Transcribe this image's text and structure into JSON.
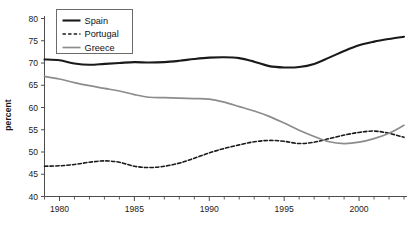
{
  "chart_data": {
    "type": "line",
    "title": "",
    "xlabel": "",
    "ylabel": "percent",
    "xlim": [
      1979,
      2003
    ],
    "ylim": [
      40,
      80
    ],
    "grid": false,
    "legend_position": "top-left",
    "y_ticks": [
      40,
      45,
      50,
      55,
      60,
      65,
      70,
      75,
      80
    ],
    "x_ticks_major": [
      1980,
      1985,
      1990,
      1995,
      2000
    ],
    "x_ticks_minor": [
      1979,
      1981,
      1982,
      1983,
      1984,
      1986,
      1987,
      1988,
      1989,
      1991,
      1992,
      1993,
      1994,
      1996,
      1997,
      1998,
      1999,
      2001,
      2002,
      2003
    ],
    "x": [
      1979,
      1980,
      1981,
      1982,
      1983,
      1984,
      1985,
      1986,
      1987,
      1988,
      1989,
      1990,
      1991,
      1992,
      1993,
      1994,
      1995,
      1996,
      1997,
      1998,
      1999,
      2000,
      2001,
      2002,
      2003
    ],
    "series": [
      {
        "name": "Spain",
        "color": "#1a1a1a",
        "style": "solid",
        "width": 2.1,
        "values": [
          70.8,
          70.6,
          69.9,
          69.6,
          69.8,
          70.0,
          70.2,
          70.1,
          70.2,
          70.5,
          70.9,
          71.2,
          71.3,
          71.1,
          70.3,
          69.3,
          69.0,
          69.1,
          69.8,
          71.2,
          72.7,
          74.0,
          74.8,
          75.4,
          75.9
        ]
      },
      {
        "name": "Portugal",
        "color": "#1a1a1a",
        "style": "dashed",
        "width": 1.6,
        "values": [
          46.8,
          46.9,
          47.2,
          47.7,
          48.0,
          47.7,
          46.8,
          46.5,
          46.8,
          47.5,
          48.6,
          49.8,
          50.8,
          51.6,
          52.3,
          52.6,
          52.4,
          51.9,
          52.2,
          53.0,
          53.8,
          54.4,
          54.7,
          54.2,
          53.3
        ]
      },
      {
        "name": "Greece",
        "color": "#8c8c8c",
        "style": "solid",
        "width": 1.7,
        "values": [
          67.0,
          66.4,
          65.6,
          64.9,
          64.3,
          63.7,
          62.9,
          62.3,
          62.2,
          62.1,
          62.0,
          61.9,
          61.2,
          60.2,
          59.2,
          58.0,
          56.5,
          54.9,
          53.5,
          52.3,
          51.9,
          52.2,
          53.0,
          54.2,
          56.0
        ]
      }
    ]
  },
  "legend": {
    "entries": [
      {
        "label": "Spain"
      },
      {
        "label": "Portugal"
      },
      {
        "label": "Greece"
      }
    ]
  },
  "axes": {
    "y_title": "percent",
    "y_tick_labels": [
      "40",
      "45",
      "50",
      "55",
      "60",
      "65",
      "70",
      "75",
      "80"
    ],
    "x_tick_labels": [
      "1980",
      "1985",
      "1990",
      "1995",
      "2000"
    ]
  }
}
